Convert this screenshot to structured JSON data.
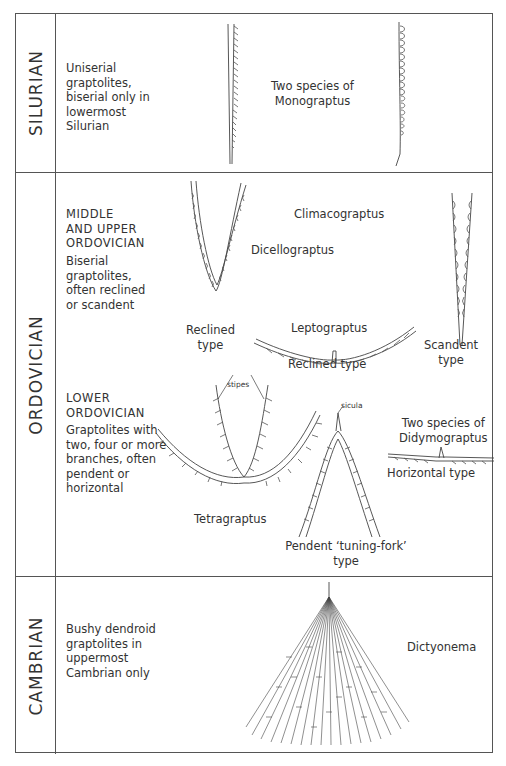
{
  "periods": [
    {
      "name": "SILURIAN",
      "description": [
        "Uniserial",
        "graptolites,",
        "biserial only in",
        "lowermost",
        "Silurian"
      ],
      "captions": {
        "monograptus": [
          "Two species of",
          "Monograptus"
        ]
      }
    },
    {
      "name": "ORDOVICIAN",
      "middle_upper": {
        "heading": [
          "MIDDLE",
          "AND UPPER",
          "ORDOVICIAN"
        ],
        "description": [
          "Biserial",
          "graptolites,",
          "often reclined",
          "or scandent"
        ],
        "captions": {
          "dicellograptus": "Dicellograptus",
          "reclined_type_1": [
            "Reclined",
            "type"
          ],
          "leptograptus": "Leptograptus",
          "reclined_type_2": "Reclined type",
          "climacograptus": "Climacograptus",
          "scandent_type": [
            "Scandent",
            "type"
          ]
        }
      },
      "lower": {
        "heading": [
          "LOWER",
          "ORDOVICIAN"
        ],
        "description": [
          "Graptolites with",
          "two, four or more",
          "branches, often",
          "pendent or",
          "horizontal"
        ],
        "captions": {
          "stipes": "stipes",
          "sicula": "sicula",
          "tetragraptus": "Tetragraptus",
          "pendent_type": [
            "Pendent ‘tuning-fork’",
            "type"
          ],
          "didymograptus": [
            "Two species of",
            "Didymograptus"
          ],
          "horizontal_type": "Horizontal type"
        }
      }
    },
    {
      "name": "CAMBRIAN",
      "description": [
        "Bushy dendroid",
        "graptolites in",
        "uppermost",
        "Cambrian only"
      ],
      "captions": {
        "dictyonema": "Dictyonema"
      }
    }
  ]
}
